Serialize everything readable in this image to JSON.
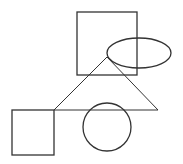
{
  "canvas": {
    "width": 183,
    "height": 164,
    "background": "#ffffff",
    "stroke": "#333333"
  },
  "shapes": {
    "top_square": {
      "type": "rect",
      "x": 77,
      "y": 12,
      "width": 60,
      "height": 63
    },
    "ellipse": {
      "type": "ellipse",
      "cx": 139,
      "cy": 53,
      "rx": 32,
      "ry": 15
    },
    "triangle": {
      "type": "polygon",
      "points": "107,57 54,110 158,110"
    },
    "bottom_square": {
      "type": "rect",
      "x": 12,
      "y": 110,
      "width": 42,
      "height": 45
    },
    "circle": {
      "type": "circle",
      "cx": 107,
      "cy": 127,
      "r": 24
    }
  }
}
